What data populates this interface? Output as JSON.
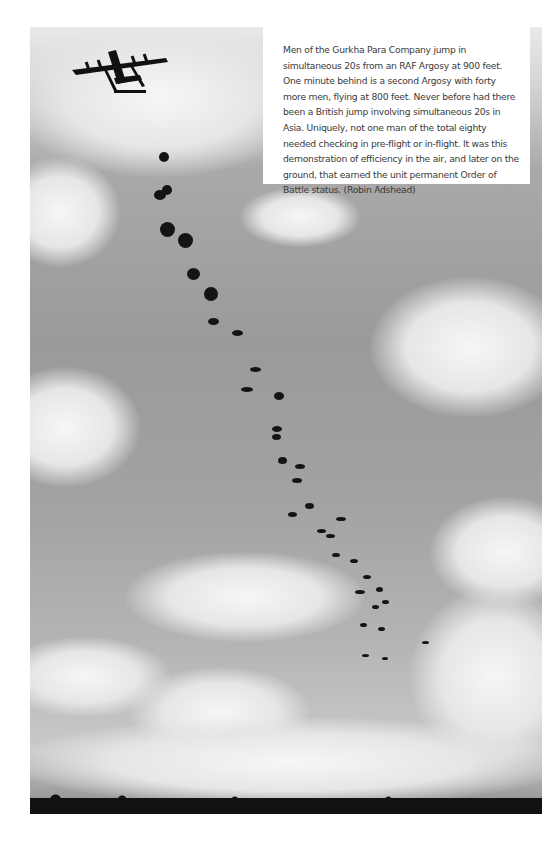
{
  "page": {
    "type": "book-page",
    "photo": {
      "subject": "parachute-drop-photo",
      "description": "Aircraft releasing paratroopers, trail of parachutes descending across a cloudy sky"
    },
    "caption": {
      "text": "Men of the Gurkha Para Company jump in simultaneous 20s from an RAF Argosy at 900 feet. One minute behind is a second Argosy with forty more men, flying at 800 feet. Never before had there been a British jump involving simultaneous 20s in Asia. Uniquely, not one man of the total eighty needed checking in pre-flight or in-flight. It was this demonstration of efficiency in the air, and later on the ground, that earned the unit permanent Order of Battle status. (Robin Adshead)",
      "credit": "Robin Adshead"
    },
    "colors": {
      "background": "#ffffff",
      "caption_text": "#3a3a3a",
      "sky": "#a0a0a0"
    }
  }
}
